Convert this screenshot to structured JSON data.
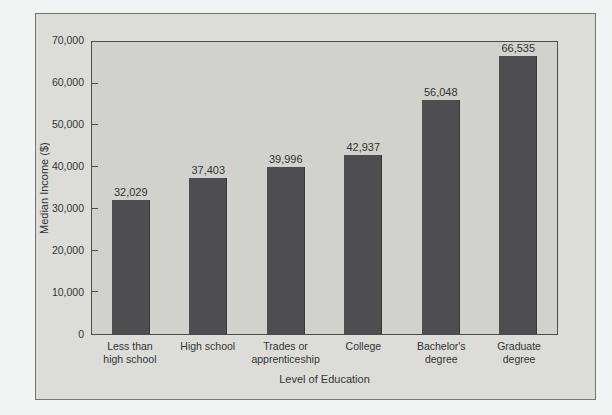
{
  "chart_data": {
    "type": "bar",
    "xlabel": "Level of Education",
    "ylabel": "Median Income ($)",
    "categories": [
      "Less than high school",
      "High school",
      "Trades or apprenticeship",
      "College",
      "Bachelor's degree",
      "Graduate degree"
    ],
    "category_label_lines": [
      [
        "Less than",
        "high school"
      ],
      [
        "High school"
      ],
      [
        "Trades or",
        "apprenticeship"
      ],
      [
        "College"
      ],
      [
        "Bachelor's",
        "degree"
      ],
      [
        "Graduate",
        "degree"
      ]
    ],
    "values": [
      32029,
      37403,
      39996,
      42937,
      56048,
      66535
    ],
    "value_labels": [
      "32,029",
      "37,403",
      "39,996",
      "42,937",
      "56,048",
      "66,535"
    ],
    "ylim": [
      0,
      70000
    ],
    "ytick_interval": 10000,
    "ytick_labels": [
      "0",
      "10,000",
      "20,000",
      "30,000",
      "40,000",
      "50,000",
      "60,000",
      "70,000"
    ],
    "grid": false,
    "legend": "none",
    "colors": {
      "page_bg": "#f2f4f3",
      "card_bg": "#dcddd9",
      "card_border": "#74756f",
      "plot_bg": "#d1d2ce",
      "axis": "#4c4d49",
      "bar": "#4e4e50",
      "text": "#333333"
    }
  }
}
